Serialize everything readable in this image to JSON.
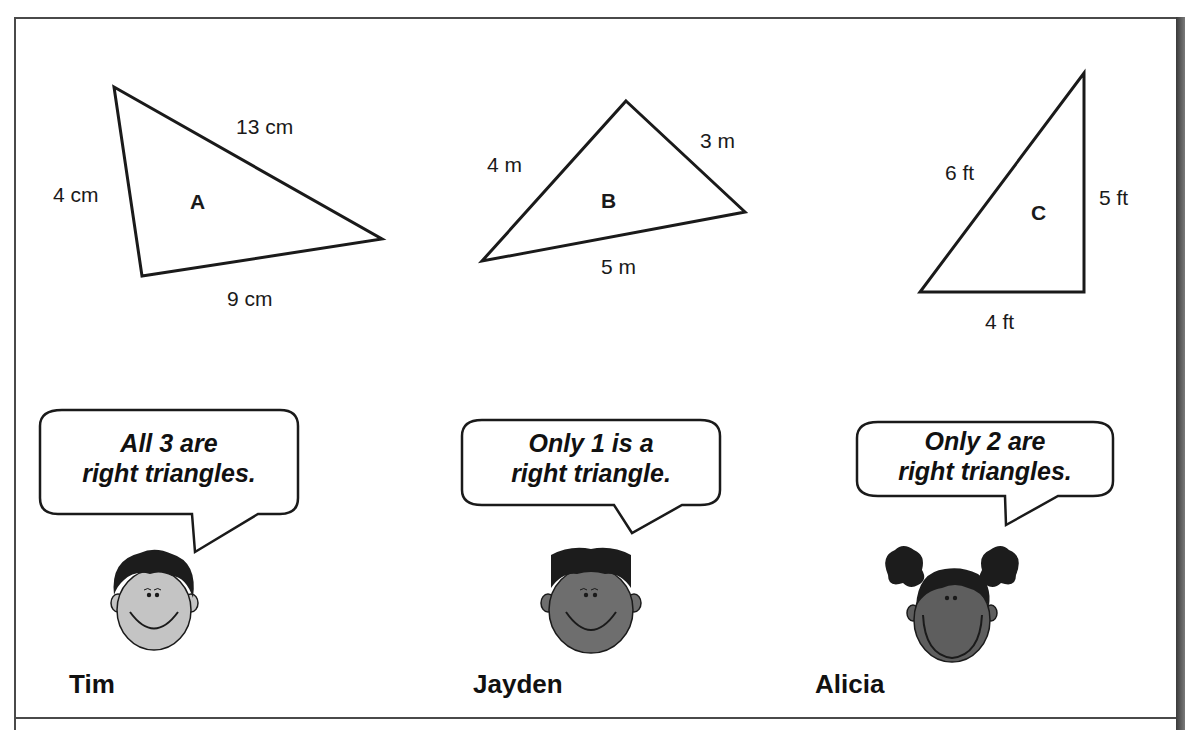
{
  "triangles": [
    {
      "name": "A",
      "sides": {
        "left": "4 cm",
        "top": "13 cm",
        "bottom": "9 cm"
      }
    },
    {
      "name": "B",
      "sides": {
        "left": "4 m",
        "right": "3 m",
        "bottom": "5 m"
      }
    },
    {
      "name": "C",
      "sides": {
        "hypotenuse": "6 ft",
        "right": "5 ft",
        "bottom": "4 ft"
      }
    }
  ],
  "students": [
    {
      "name": "Tim",
      "claim_line1": "All 3 are",
      "claim_line2": "right triangles.",
      "skin": "#c4c4c4",
      "hair": "#1c1c1c"
    },
    {
      "name": "Jayden",
      "claim_line1": "Only 1 is a",
      "claim_line2": "right triangle.",
      "skin": "#6e6e6e",
      "hair": "#1c1c1c"
    },
    {
      "name": "Alicia",
      "claim_line1": "Only 2 are",
      "claim_line2": "right triangles.",
      "skin": "#5e5e5e",
      "hair": "#1c1c1c"
    }
  ],
  "colors": {
    "line": "#1a1a1a",
    "frame": "#4a4a4a",
    "background": "#ffffff"
  }
}
